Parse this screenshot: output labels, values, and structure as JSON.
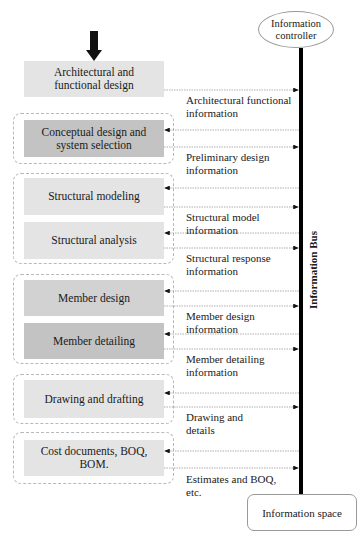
{
  "controller": {
    "label": "Information\ncontroller"
  },
  "bus": {
    "label": "Information Bus"
  },
  "space": {
    "label": "Information space"
  },
  "input_arrow": {
    "icon": "thick-down-arrow-icon"
  },
  "stages": [
    {
      "id": "arch",
      "label": "Architectural and functional design",
      "shade": "light"
    },
    {
      "id": "concept",
      "label": "Conceptual design and system selection",
      "shade": "dark"
    },
    {
      "id": "modeling",
      "label": "Structural modeling",
      "shade": "light"
    },
    {
      "id": "analysis",
      "label": "Structural analysis",
      "shade": "light"
    },
    {
      "id": "member-design",
      "label": "Member design",
      "shade": "mid"
    },
    {
      "id": "member-detailing",
      "label": "Member detailing",
      "shade": "dark"
    },
    {
      "id": "drawing",
      "label": "Drawing and drafting",
      "shade": "light"
    },
    {
      "id": "cost",
      "label": "Cost documents, BOQ, BOM.",
      "shade": "light"
    }
  ],
  "info_labels": [
    "Architectural functional\ninformation",
    "Preliminary design\ninformation",
    "Structural model\ninformation",
    "Structural response\ninformation",
    "Member design\ninformation",
    "Member detailing\ninformation",
    "Drawing and\ndetails",
    "Estimates and BOQ,\netc."
  ],
  "colors": {
    "light_box": "#e4e4e4",
    "mid_box": "#d2d2d2",
    "dark_box": "#c3c3c3",
    "bus": "#000000",
    "arrow_line": "#9a9a9a"
  }
}
